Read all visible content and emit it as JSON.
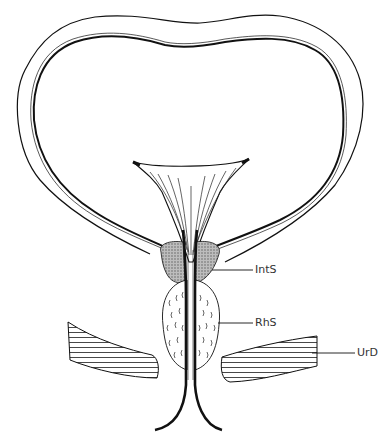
{
  "diagram": {
    "labels": [
      {
        "id": "ints",
        "text": "IntS",
        "x": 255,
        "y": 264
      },
      {
        "id": "rhs",
        "text": "RhS",
        "x": 255,
        "y": 317
      },
      {
        "id": "urd",
        "text": "UrD",
        "x": 357,
        "y": 347
      }
    ],
    "colors": {
      "stroke": "#111111",
      "sphincter_fill": "#9a9a9a",
      "background": "#ffffff"
    }
  }
}
